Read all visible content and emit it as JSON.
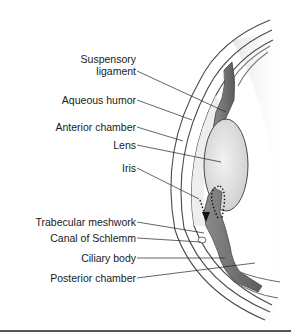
{
  "diagram": {
    "labels": [
      {
        "id": "suspensory-ligament",
        "lines": [
          "Suspensory",
          "ligament"
        ],
        "right": 136,
        "top": 53,
        "line": [
          137,
          71,
          226,
          112
        ]
      },
      {
        "id": "aqueous-humor",
        "lines": [
          "Aqueous humor"
        ],
        "right": 136,
        "top": 94,
        "line": [
          137,
          100,
          192,
          120
        ]
      },
      {
        "id": "anterior-chamber",
        "lines": [
          "Anterior chamber"
        ],
        "right": 136,
        "top": 121,
        "line": [
          137,
          127,
          183,
          141
        ]
      },
      {
        "id": "lens",
        "lines": [
          "Lens"
        ],
        "right": 136,
        "top": 139,
        "line": [
          137,
          145,
          221,
          162
        ]
      },
      {
        "id": "iris",
        "lines": [
          "Iris"
        ],
        "right": 136,
        "top": 162,
        "line": [
          137,
          168,
          199,
          199
        ]
      },
      {
        "id": "trabecular-meshwork",
        "lines": [
          "Trabecular meshwork"
        ],
        "right": 136,
        "top": 216,
        "line": [
          137,
          222,
          204,
          233
        ]
      },
      {
        "id": "canal-of-schlemm",
        "lines": [
          "Canal of Schlemm"
        ],
        "right": 136,
        "top": 232,
        "line": [
          137,
          238,
          201,
          242
        ]
      },
      {
        "id": "ciliary-body",
        "lines": [
          "Ciliary body"
        ],
        "right": 136,
        "top": 252,
        "line": [
          137,
          258,
          225,
          258
        ]
      },
      {
        "id": "posterior-chamber",
        "lines": [
          "Posterior chamber"
        ],
        "right": 136,
        "top": 272,
        "line": [
          137,
          278,
          255,
          263
        ]
      }
    ],
    "colors": {
      "text": "#1a1a1a",
      "leader": "#222222",
      "tissue_dark": "#6e6e6e",
      "tissue_mid": "#9a9a9a",
      "tissue_light": "#d8d8d8",
      "lens": "#e4e4e4",
      "outline": "#4a4a4a",
      "rule": "#555555"
    }
  }
}
